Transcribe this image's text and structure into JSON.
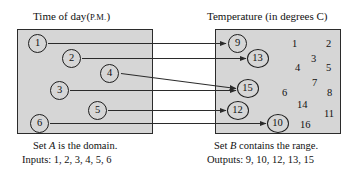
{
  "figure": {
    "type": "function-mapping-diagram",
    "width": 355,
    "height": 171,
    "background": "#ffffff",
    "box_fill": "#d6d6d6",
    "stroke": "#2b2b2b"
  },
  "set_a": {
    "title_main": "Time of day",
    "title_paren_open": "(",
    "title_smallcaps": "P.M.",
    "title_paren_close": ")",
    "caption_line1_pre": "Set ",
    "caption_line1_var": "A",
    "caption_line1_post": " is the domain.",
    "caption_line2": "Inputs: 1, 2, 3, 4, 5, 6",
    "elements": [
      {
        "label": "1",
        "x": 28,
        "y": 34
      },
      {
        "label": "2",
        "x": 62,
        "y": 49
      },
      {
        "label": "3",
        "x": 50,
        "y": 81
      },
      {
        "label": "4",
        "x": 100,
        "y": 64
      },
      {
        "label": "5",
        "x": 88,
        "y": 101
      },
      {
        "label": "6",
        "x": 30,
        "y": 114
      }
    ]
  },
  "set_b": {
    "title_main": "Temperature (in degrees C)",
    "caption_line1_pre": "Set ",
    "caption_line1_var": "B",
    "caption_line1_post": " contains the range.",
    "caption_line2": "Outputs: 9, 10, 12, 13, 15",
    "elements": [
      {
        "label": "9",
        "x": 228,
        "y": 34,
        "wide": false
      },
      {
        "label": "13",
        "x": 248,
        "y": 49,
        "wide": true
      },
      {
        "label": "15",
        "x": 238,
        "y": 79,
        "wide": true
      },
      {
        "label": "12",
        "x": 228,
        "y": 101,
        "wide": true
      },
      {
        "label": "10",
        "x": 268,
        "y": 114,
        "wide": true
      }
    ],
    "scattered": [
      {
        "label": "1",
        "x": 292,
        "y": 38
      },
      {
        "label": "2",
        "x": 326,
        "y": 38
      },
      {
        "label": "3",
        "x": 311,
        "y": 53
      },
      {
        "label": "4",
        "x": 295,
        "y": 62
      },
      {
        "label": "5",
        "x": 326,
        "y": 62
      },
      {
        "label": "7",
        "x": 312,
        "y": 77
      },
      {
        "label": "6",
        "x": 282,
        "y": 87
      },
      {
        "label": "8",
        "x": 327,
        "y": 87
      },
      {
        "label": "14",
        "x": 297,
        "y": 99
      },
      {
        "label": "11",
        "x": 324,
        "y": 108
      },
      {
        "label": "16",
        "x": 300,
        "y": 119
      }
    ]
  },
  "mappings": [
    {
      "from": "1",
      "to": "9",
      "x1": 48,
      "y1": 43.5,
      "x2": 226,
      "y2": 43.5
    },
    {
      "from": "2",
      "to": "13",
      "x1": 82,
      "y1": 58.5,
      "x2": 246,
      "y2": 58.5
    },
    {
      "from": "4",
      "to": "15",
      "x1": 121,
      "y1": 73.5,
      "x2": 236,
      "y2": 88.5
    },
    {
      "from": "3",
      "to": "15",
      "x1": 70,
      "y1": 90.5,
      "x2": 236,
      "y2": 90.5
    },
    {
      "from": "5",
      "to": "12",
      "x1": 108,
      "y1": 110.5,
      "x2": 226,
      "y2": 110.5
    },
    {
      "from": "6",
      "to": "10",
      "x1": 50,
      "y1": 123.5,
      "x2": 266,
      "y2": 123.5
    }
  ]
}
